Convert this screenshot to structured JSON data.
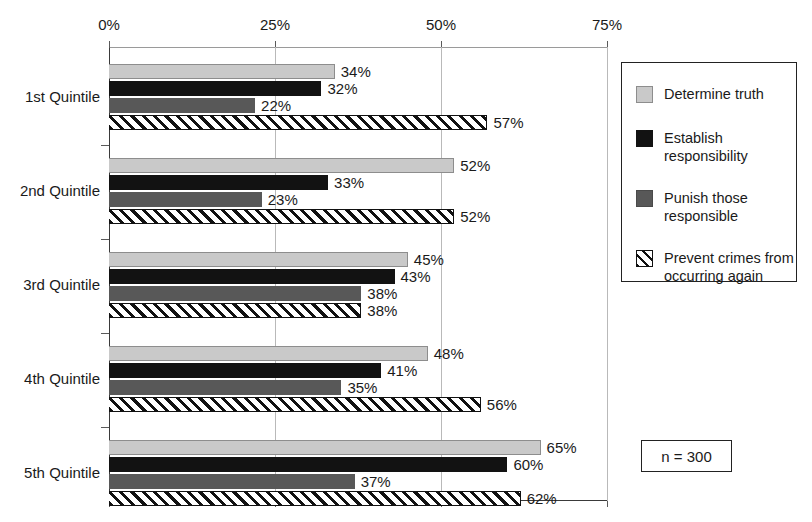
{
  "chart_data": {
    "type": "bar",
    "orientation": "horizontal",
    "title": "",
    "xlabel": "",
    "ylabel": "",
    "xlim": [
      0,
      75
    ],
    "grid": true,
    "legend_position": "right",
    "annotation": "n = 300",
    "categories": [
      "1st Quintile",
      "2nd Quintile",
      "3rd Quintile",
      "4th Quintile",
      "5th Quintile"
    ],
    "xticks": [
      {
        "value": 0,
        "label": "0%"
      },
      {
        "value": 25,
        "label": "25%"
      },
      {
        "value": 50,
        "label": "50%"
      },
      {
        "value": 75,
        "label": "75%"
      }
    ],
    "series": [
      {
        "name": "Determine truth",
        "legend_label": "Determine truth",
        "swatch": "light-gray",
        "values": [
          34,
          52,
          45,
          48,
          65
        ],
        "labels": [
          "34%",
          "52%",
          "45%",
          "48%",
          "65%"
        ]
      },
      {
        "name": "Establish responsibility",
        "legend_label": "Establish\nresponsibility",
        "swatch": "black",
        "values": [
          32,
          33,
          43,
          41,
          60
        ],
        "labels": [
          "32%",
          "33%",
          "43%",
          "41%",
          "60%"
        ]
      },
      {
        "name": "Punish those responsible",
        "legend_label": "Punish those\nresponsible",
        "swatch": "dark-gray",
        "values": [
          22,
          23,
          38,
          35,
          37
        ],
        "labels": [
          "22%",
          "23%",
          "38%",
          "35%",
          "37%"
        ]
      },
      {
        "name": "Prevent crimes from occurring again",
        "legend_label": "Prevent crimes from\noccurring again",
        "swatch": "hatched",
        "values": [
          57,
          52,
          38,
          56,
          62
        ],
        "labels": [
          "57%",
          "52%",
          "38%",
          "56%",
          "62%"
        ]
      }
    ]
  },
  "colors": {
    "series_light_gray": "#c9c9c9",
    "series_black": "#121212",
    "series_dark_gray": "#585858",
    "series_hatched": "#ffffff",
    "axis": "#3a3a3a",
    "gridline": "#b9b9b9",
    "text": "#1a1a1a",
    "background": "#ffffff"
  }
}
